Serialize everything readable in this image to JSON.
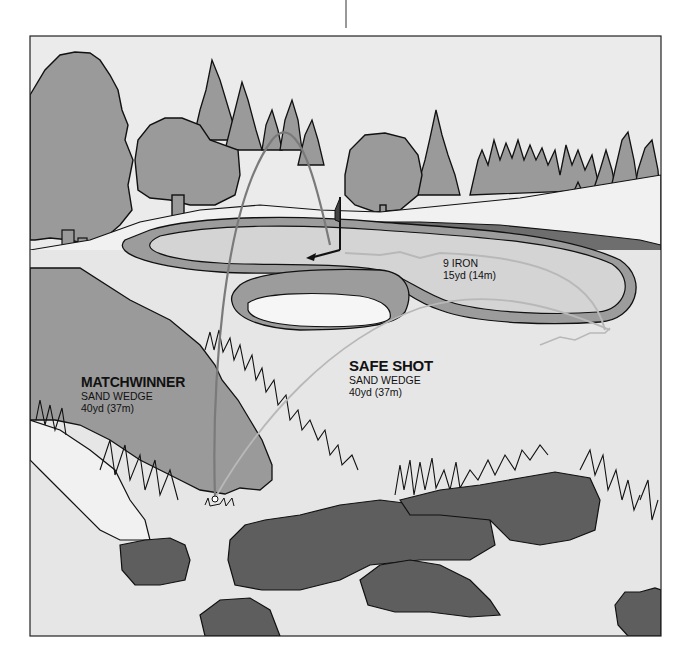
{
  "illustration": {
    "subject": "Golf bunker shot options diagram",
    "colors": {
      "sky": "#ebebeb",
      "tree": "#9a9a9a",
      "fairway_light": "#e3e3e3",
      "green": "#d4d4d4",
      "fringe": "#9c9c9c",
      "bunker_sand": "#f6f6f6",
      "rough_dark": "#5e5e5e",
      "hill": "#9a9a9a",
      "matchwinner_path": "#7a7a7a",
      "safe_path": "#b8b8b8",
      "outline": "#111111"
    }
  },
  "annotations": {
    "matchwinner": {
      "title": "MATCHWINNER",
      "club": "SAND WEDGE",
      "distance": "40yd (37m)"
    },
    "safe_shot": {
      "title": "SAFE SHOT",
      "club": "SAND WEDGE",
      "distance": "40yd (37m)"
    },
    "nine_iron": {
      "club": "9 IRON",
      "distance": "15yd (14m)"
    }
  }
}
